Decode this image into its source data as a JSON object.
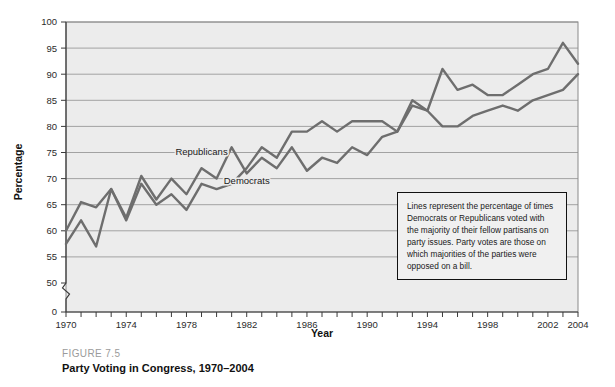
{
  "caption": {
    "figure_number": "FIGURE 7.5",
    "figure_title": "Party Voting in Congress, 1970–2004"
  },
  "note": {
    "text": "Lines represent the percentage of times Democrats or Republicans voted with the majority of their fellow partisans on party issues. Party votes are those on which majorities of the parties were opposed on a bill."
  },
  "chart_data": {
    "type": "line",
    "title": "Party Voting in Congress, 1970–2004",
    "xlabel": "Year",
    "ylabel": "Percentage",
    "xlim": [
      1970,
      2004
    ],
    "ylim": [
      50,
      100
    ],
    "y_axis_zero_shown": true,
    "y_axis_break": true,
    "grid": true,
    "legend_position": "inline-labels",
    "y_ticks": [
      0,
      50,
      55,
      60,
      65,
      70,
      75,
      80,
      85,
      90,
      95,
      100
    ],
    "x_ticks": [
      1970,
      1971,
      1972,
      1973,
      1974,
      1975,
      1976,
      1977,
      1978,
      1979,
      1980,
      1981,
      1982,
      1983,
      1984,
      1985,
      1986,
      1987,
      1988,
      1989,
      1990,
      1991,
      1992,
      1993,
      1994,
      1995,
      1996,
      1997,
      1998,
      1999,
      2000,
      2001,
      2002,
      2003,
      2004
    ],
    "x_tick_labels": [
      "1970",
      "",
      "",
      "",
      "1974",
      "",
      "",
      "",
      "1978",
      "",
      "",
      "",
      "1982",
      "",
      "",
      "",
      "1986",
      "",
      "",
      "",
      "1990",
      "",
      "",
      "",
      "1994",
      "",
      "",
      "",
      "1998",
      "",
      "",
      "",
      "2002",
      "",
      "2004"
    ],
    "x": [
      1970,
      1971,
      1972,
      1973,
      1974,
      1975,
      1976,
      1977,
      1978,
      1979,
      1980,
      1981,
      1982,
      1983,
      1984,
      1985,
      1986,
      1987,
      1988,
      1989,
      1990,
      1991,
      1992,
      1993,
      1994,
      1995,
      1996,
      1997,
      1998,
      1999,
      2000,
      2001,
      2002,
      2003,
      2004
    ],
    "series": [
      {
        "name": "Republicans",
        "color": "#6e6e6e",
        "label_x": 1979,
        "label_y": 74.5,
        "values": [
          60,
          65.5,
          64.5,
          68,
          62.5,
          70.5,
          66,
          70,
          67,
          72,
          70,
          76,
          71,
          74,
          72,
          76,
          71.5,
          74,
          73,
          76,
          74.5,
          78,
          79,
          84,
          83,
          91,
          87,
          88,
          86,
          86,
          88,
          90,
          91,
          96,
          92
        ]
      },
      {
        "name": "Democrats",
        "color": "#6e6e6e",
        "label_x": 1982,
        "label_y": 69,
        "values": [
          57.5,
          62,
          57,
          68,
          62,
          69,
          65,
          67,
          64,
          69,
          68,
          69,
          72,
          76,
          74,
          79,
          79,
          81,
          79,
          81,
          81,
          81,
          79,
          85,
          83,
          80,
          80,
          82,
          83,
          84,
          83,
          85,
          86,
          87,
          90
        ]
      }
    ],
    "annotations": [
      {
        "name": "note-box",
        "text": "Lines represent the percentage of times Democrats or Republicans voted with the majority of their fellow partisans on party issues. Party votes are those on which majorities of the parties were opposed on a bill."
      }
    ]
  }
}
